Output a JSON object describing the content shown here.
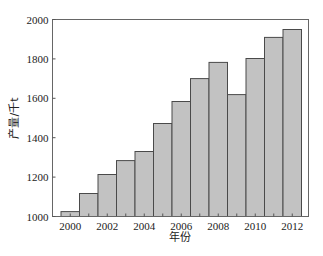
{
  "chart_data": {
    "type": "bar",
    "title": "",
    "xlabel": "年份",
    "ylabel": "产量/千t",
    "categories": [
      "2000",
      "2001",
      "2002",
      "2003",
      "2004",
      "2005",
      "2006",
      "2007",
      "2008",
      "2009",
      "2010",
      "2011",
      "2012"
    ],
    "values": [
      1025,
      1117,
      1213,
      1284,
      1330,
      1472,
      1584,
      1700,
      1782,
      1619,
      1802,
      1909,
      1949
    ],
    "ylim": [
      1000,
      2000
    ],
    "yticks": [
      1000,
      1200,
      1400,
      1600,
      1800,
      2000
    ],
    "xtick_labels": [
      "2000",
      "2002",
      "2004",
      "2006",
      "2008",
      "2010",
      "2012"
    ],
    "grid": false,
    "legend": null,
    "colors": {
      "bar_fill": "#c2c2c2",
      "bar_edge": "#4a4a4a",
      "frame": "#666666"
    }
  }
}
